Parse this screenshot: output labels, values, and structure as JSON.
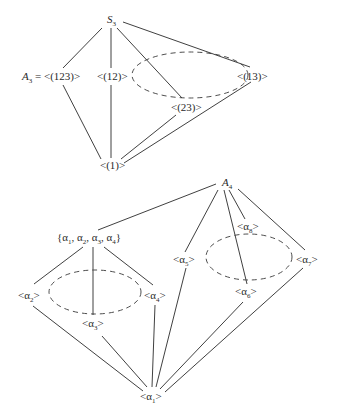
{
  "diagrams": [
    {
      "name": "S3 subgroup lattice",
      "nodes": {
        "S3": {
          "base": "S",
          "sub": "3"
        },
        "A3": {
          "base": "A",
          "sub": "3",
          "suffix": " = <(123)>"
        },
        "c12": {
          "text": "<(12)>"
        },
        "c13": {
          "text": "<(13)>"
        },
        "c23": {
          "text": "<(23)>"
        },
        "e": {
          "text": "<(1)>"
        }
      },
      "edges": [
        [
          "S3",
          "A3"
        ],
        [
          "S3",
          "c12"
        ],
        [
          "S3",
          "c13"
        ],
        [
          "S3",
          "c23"
        ],
        [
          "A3",
          "e"
        ],
        [
          "c12",
          "e"
        ],
        [
          "c13",
          "e"
        ],
        [
          "c23",
          "e"
        ]
      ],
      "conjugacy_class": [
        "c12",
        "c13",
        "c23"
      ]
    },
    {
      "name": "A4 subgroup lattice",
      "nodes": {
        "A4": {
          "base": "A",
          "sub": "4"
        },
        "V": {
          "text_parts": [
            "{α",
            "1",
            ", α",
            "2",
            ", α",
            "3",
            ", α",
            "4",
            "}"
          ]
        },
        "a2": {
          "base": "<α",
          "sub": "2",
          "suffix": ">"
        },
        "a3": {
          "base": "<α",
          "sub": "3",
          "suffix": ">"
        },
        "a4": {
          "base": "<α",
          "sub": "4",
          "suffix": ">"
        },
        "a5": {
          "base": "<α",
          "sub": "5",
          "suffix": ">"
        },
        "a6": {
          "base": "<α",
          "sub": "6",
          "suffix": ">"
        },
        "a7": {
          "base": "<α",
          "sub": "7",
          "suffix": ">"
        },
        "a8": {
          "base": "<α",
          "sub": "8",
          "suffix": ">"
        },
        "a1": {
          "base": "<α",
          "sub": "1",
          "suffix": ">"
        }
      },
      "edges": [
        [
          "A4",
          "V"
        ],
        [
          "A4",
          "a5"
        ],
        [
          "A4",
          "a6"
        ],
        [
          "A4",
          "a7"
        ],
        [
          "A4",
          "a8"
        ],
        [
          "V",
          "a2"
        ],
        [
          "V",
          "a3"
        ],
        [
          "V",
          "a4"
        ],
        [
          "a2",
          "a1"
        ],
        [
          "a3",
          "a1"
        ],
        [
          "a4",
          "a1"
        ],
        [
          "a5",
          "a1"
        ],
        [
          "a6",
          "a1"
        ],
        [
          "a7",
          "a1"
        ]
      ],
      "conjugacy_classes": [
        [
          "a2",
          "a3",
          "a4"
        ],
        [
          "a5",
          "a6",
          "a7",
          "a8"
        ]
      ]
    }
  ]
}
